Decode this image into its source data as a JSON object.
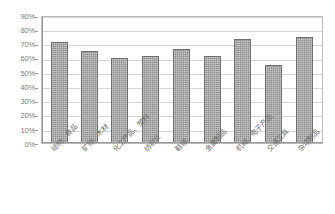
{
  "chart_data": {
    "type": "bar",
    "title": "",
    "subtitle": "",
    "xlabel": "",
    "ylabel": "",
    "ylim": [
      0,
      0.9
    ],
    "grid": true,
    "legend": false,
    "legend_position": "none",
    "orientation": "vertical",
    "categories": [
      "动物、食品",
      "矿物、木材",
      "化工产品、塑料",
      "纺织业",
      "鞋帽",
      "金属制品",
      "机械、电子产品",
      "交通工具",
      "杂项制品"
    ],
    "values": [
      0.72,
      0.66,
      0.605,
      0.62,
      0.67,
      0.625,
      0.745,
      0.56,
      0.76
    ],
    "value_labels": [
      "72%",
      "66%",
      "60.5%",
      "62%",
      "67%",
      "62.5%",
      "74.5%",
      "56%",
      "76%"
    ],
    "ytick_values": [
      0.0,
      0.1,
      0.2,
      0.3,
      0.4,
      0.5,
      0.6,
      0.7,
      0.8,
      0.9
    ],
    "ytick_labels": [
      "0%",
      "10%",
      "20%",
      "30%",
      "40%",
      "50%",
      "60%",
      "70%",
      "80%",
      "90%"
    ],
    "series": [
      {
        "name": "series-1",
        "values": [
          0.72,
          0.66,
          0.605,
          0.62,
          0.67,
          0.625,
          0.745,
          0.56,
          0.76
        ]
      }
    ],
    "colors": {
      "bar_fill": "#8c8c8c",
      "bar_border": "#6f6f6f",
      "gridline": "#d6d6d6",
      "axis": "#9a9a9a",
      "plot_border": "#b9b9b9",
      "tick_text": "#7a7a7a",
      "background": "#ffffff"
    }
  }
}
